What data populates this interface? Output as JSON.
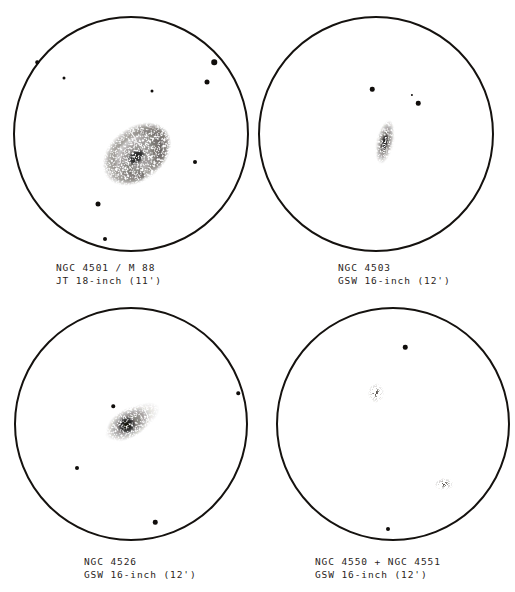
{
  "plate": {
    "title": "Eyepiece sketches of Virgo cluster galaxies",
    "background_color": "#ffffff",
    "ink_color": "#15120f",
    "caption_color": "#2a2522"
  },
  "panels": [
    {
      "id": "panel-ngc4501",
      "caption_line1": "NGC 4501 / M 88",
      "caption_line2": "JT 18-inch (11')",
      "object_designations": [
        "NGC 4501",
        "M 88"
      ],
      "observer_initials": "JT",
      "aperture": "18-inch",
      "field_of_view": "11'",
      "circle": {
        "cx": 131,
        "cy": 134,
        "r": 118
      },
      "caption_pos": {
        "x": 56,
        "y": 262
      },
      "galaxies": [
        {
          "name": "M 88",
          "type": "spiral",
          "cx": 137,
          "cy": 154,
          "w": 84,
          "h": 62,
          "rot": -38
        }
      ],
      "stars": [
        {
          "cx": 37,
          "cy": 62,
          "d": 3.5
        },
        {
          "cx": 64,
          "cy": 78,
          "d": 3.0
        },
        {
          "cx": 214,
          "cy": 62,
          "d": 5.5
        },
        {
          "cx": 207,
          "cy": 82,
          "d": 5.0
        },
        {
          "cx": 152,
          "cy": 91,
          "d": 3.0
        },
        {
          "cx": 195,
          "cy": 162,
          "d": 4.0
        },
        {
          "cx": 98,
          "cy": 204,
          "d": 5.0
        },
        {
          "cx": 105,
          "cy": 239,
          "d": 4.0
        }
      ]
    },
    {
      "id": "panel-ngc4503",
      "caption_line1": "NGC 4503",
      "caption_line2": "GSW 16-inch (12')",
      "object_designations": [
        "NGC 4503"
      ],
      "observer_initials": "GSW",
      "aperture": "16-inch",
      "field_of_view": "12'",
      "circle": {
        "cx": 376,
        "cy": 134,
        "r": 118
      },
      "caption_pos": {
        "x": 338,
        "y": 262
      },
      "galaxies": [
        {
          "name": "NGC 4503",
          "type": "edge-on",
          "cx": 385,
          "cy": 142,
          "w": 20,
          "h": 44,
          "rot": 12
        }
      ],
      "stars": [
        {
          "cx": 372,
          "cy": 89,
          "d": 4.5
        },
        {
          "cx": 412,
          "cy": 95,
          "d": 2.2
        },
        {
          "cx": 418,
          "cy": 103,
          "d": 4.5
        }
      ]
    },
    {
      "id": "panel-ngc4526",
      "caption_line1": "NGC 4526",
      "caption_line2": "GSW 16-inch (12')",
      "object_designations": [
        "NGC 4526"
      ],
      "observer_initials": "GSW",
      "aperture": "16-inch",
      "field_of_view": "12'",
      "circle": {
        "cx": 131,
        "cy": 424,
        "r": 117
      },
      "caption_pos": {
        "x": 84,
        "y": 556
      },
      "galaxies": [
        {
          "name": "NGC 4526",
          "type": "lenticular",
          "cx": 131,
          "cy": 422,
          "w": 66,
          "h": 28,
          "rot": -30
        }
      ],
      "stars": [
        {
          "cx": 113,
          "cy": 406,
          "d": 3.5
        },
        {
          "cx": 238,
          "cy": 393,
          "d": 3.5
        },
        {
          "cx": 77,
          "cy": 468,
          "d": 4.0
        },
        {
          "cx": 155,
          "cy": 522,
          "d": 4.5
        }
      ]
    },
    {
      "id": "panel-ngc4550-4551",
      "caption_line1": "NGC 4550 + NGC 4551",
      "caption_line2": "GSW 16-inch (12')",
      "object_designations": [
        "NGC 4550",
        "NGC 4551"
      ],
      "observer_initials": "GSW",
      "aperture": "16-inch",
      "field_of_view": "12'",
      "circle": {
        "cx": 393,
        "cy": 424,
        "r": 117
      },
      "caption_pos": {
        "x": 315,
        "y": 556
      },
      "galaxies": [
        {
          "name": "NGC 4550",
          "type": "blob",
          "cx": 376,
          "cy": 393,
          "w": 18,
          "h": 22,
          "rot": 0
        },
        {
          "name": "NGC 4551",
          "type": "blob",
          "cx": 444,
          "cy": 484,
          "w": 22,
          "h": 14,
          "rot": 0
        }
      ],
      "stars": [
        {
          "cx": 405,
          "cy": 347,
          "d": 4.5
        },
        {
          "cx": 388,
          "cy": 529,
          "d": 4.0
        }
      ]
    }
  ]
}
